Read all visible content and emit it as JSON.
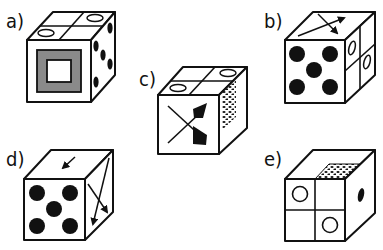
{
  "options": [
    {
      "id": "a",
      "label": "a)",
      "front": "gray square frame with white square center",
      "top": "two quadrants with ovals (back-right and front-left)",
      "right": "five black dots"
    },
    {
      "id": "b",
      "label": "b)",
      "front": "five black dots",
      "top": "two crossing arrows",
      "right": "two quadrants with ovals"
    },
    {
      "id": "c",
      "label": "c)",
      "front": "two crossing arrows",
      "top": "two quadrants with ovals",
      "right": "dotted pattern"
    },
    {
      "id": "d",
      "label": "d)",
      "front": "five black dots",
      "top": "small arrow",
      "right": "two crossing arrows"
    },
    {
      "id": "e",
      "label": "e)",
      "front": "four quadrants with two circles",
      "top": "dotted pattern quadrant",
      "right": "single black dot"
    }
  ],
  "colors": {
    "ink": "#111111",
    "gray_fill": "#8a8a8a",
    "background": "#ffffff"
  }
}
